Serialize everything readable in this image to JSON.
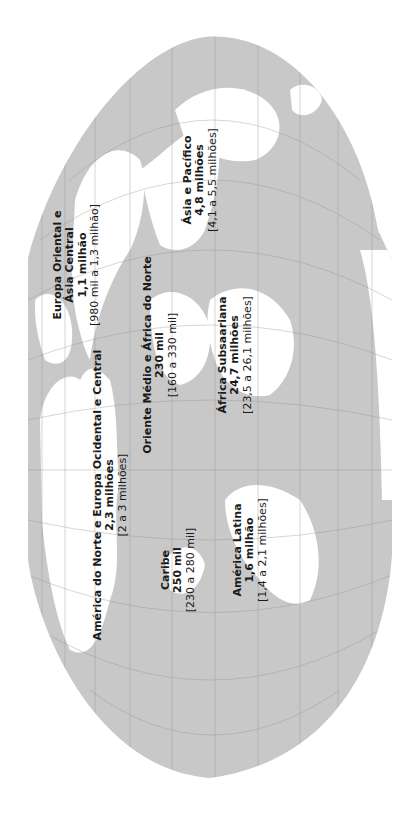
{
  "map": {
    "colors": {
      "ocean": "#c8c8c8",
      "land": "#ffffff",
      "grid": "#8a8a8a",
      "background": "#ffffff",
      "text": "#1a1a1a"
    },
    "orientation": "rotated 90deg counterclockwise",
    "regions": [
      {
        "name": "Europa Oriental e Ásia Central",
        "name_line1": "Europa Oriental e",
        "name_line2": "Ásia Central",
        "value": "1,1 milhão",
        "range": "[980 mil a 1,3 milhão]"
      },
      {
        "name": "Ásia e Pacífico",
        "value": "4,8 milhões",
        "range": "[4,1 a 5,5 milhões]"
      },
      {
        "name": "Oriente Médio e África do Norte",
        "value": "230 mil",
        "range": "[160 a 330 mil]"
      },
      {
        "name": "África Subsaariana",
        "value": "24,7 milhões",
        "range": "[23,5 a 26,1 milhões]"
      },
      {
        "name": "América do Norte e Europa Ocidental e Central",
        "value": "2,3 milhões",
        "range": "[2 a 3 milhões]"
      },
      {
        "name": "Caribe",
        "value": "250 mil",
        "range": "[230 a 280 mil]"
      },
      {
        "name": "América Latina",
        "value": "1,6 milhão",
        "range": "[1,4 a 2,1 milhões]"
      }
    ]
  }
}
